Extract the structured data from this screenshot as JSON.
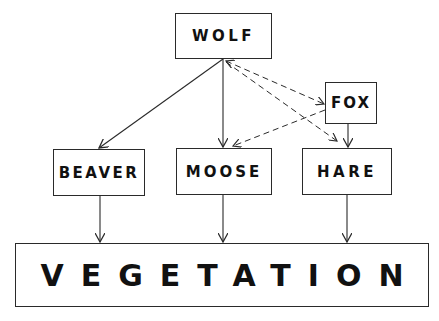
{
  "diagram": {
    "type": "food-web",
    "nodes": {
      "wolf": {
        "label": "WOLF",
        "x": 175,
        "y": 13,
        "w": 97,
        "h": 46
      },
      "fox": {
        "label": "FOX",
        "x": 325,
        "y": 82,
        "w": 52,
        "h": 42
      },
      "beaver": {
        "label": "BEAVER",
        "x": 53,
        "y": 149,
        "w": 92,
        "h": 47
      },
      "moose": {
        "label": "MOOSE",
        "x": 176,
        "y": 148,
        "w": 96,
        "h": 47
      },
      "hare": {
        "label": "HARE",
        "x": 302,
        "y": 148,
        "w": 90,
        "h": 47
      },
      "vegetation": {
        "label": "VEGETATION",
        "x": 15,
        "y": 243,
        "w": 414,
        "h": 64
      }
    },
    "edges": [
      {
        "from": "wolf",
        "to": "beaver",
        "style": "solid"
      },
      {
        "from": "wolf",
        "to": "moose",
        "style": "solid"
      },
      {
        "from": "wolf",
        "to": "fox",
        "style": "dashed"
      },
      {
        "from": "wolf",
        "to": "hare",
        "style": "dashed"
      },
      {
        "from": "fox",
        "to": "moose",
        "style": "dashed"
      },
      {
        "from": "fox",
        "to": "hare",
        "style": "solid"
      },
      {
        "from": "beaver",
        "to": "vegetation",
        "style": "solid"
      },
      {
        "from": "moose",
        "to": "vegetation",
        "style": "solid"
      },
      {
        "from": "hare",
        "to": "vegetation",
        "style": "solid"
      }
    ],
    "colors": {
      "stroke": "#2a2a2a",
      "text": "#111111",
      "background": "#ffffff"
    }
  }
}
